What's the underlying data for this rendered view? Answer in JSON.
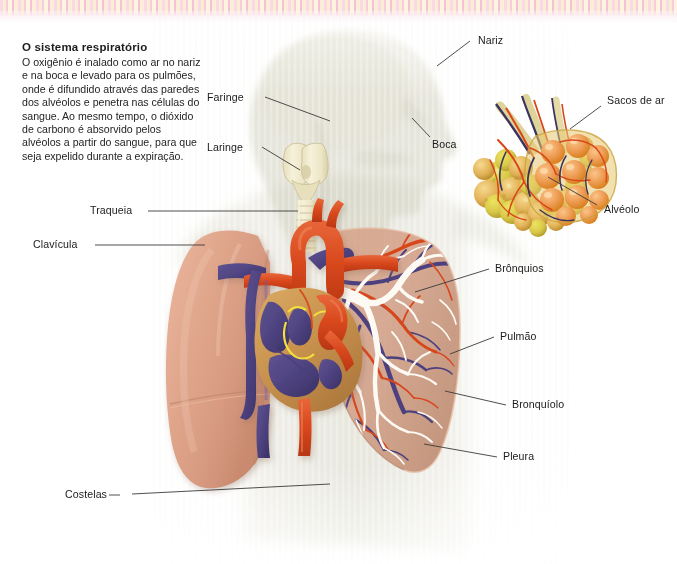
{
  "page": {
    "title": "O sistema respiratório",
    "language": "pt-BR"
  },
  "article": {
    "heading": "O sistema respiratório",
    "body": "O oxigênio é inalado como ar no nariz e na boca e levado para os pulmões, onde é difundido através das paredes dos alvéolos e penetra nas células do sangue. Ao mesmo tempo, o dióxido de carbono é absorvido pelos alvéolos a partir do sangue, para que seja expelido durante a expiração."
  },
  "labels": {
    "nariz": "Nariz",
    "boca": "Boca",
    "faringe": "Faringe",
    "laringe": "Laringe",
    "traqueia": "Traqueia",
    "clavicula": "Clavícula",
    "costelas": "Costelas",
    "bronquios": "Brônquios",
    "pulmao": "Pulmão",
    "bronquiolo": "Bronquíolo",
    "pleura": "Pleura",
    "sacos_de_ar": "Sacos de ar",
    "alveolo": "Alvéolo"
  },
  "colors": {
    "artery": "#d8471c",
    "vein": "#4c417e",
    "heart_muscle": "#c8924e",
    "valve": "#f2de3e",
    "lung_left": "#e0a389",
    "lung_right": "#d9a083",
    "bronchial_tree": "#fdfaf4",
    "cartilage": "#f0ead0",
    "alveoli_sac": "#ee9d55",
    "alveoli_cluster": "#d9c84a",
    "ghost_body": "#d9d8c8",
    "leader_line": "#3a3a3a",
    "band_pink": "#f7c9dd",
    "band_cream": "#fbeccf",
    "text": "#1b1b1b"
  },
  "figure": {
    "caption_type": "anatomical-illustration",
    "inset": "Detalhe ampliado dos sacos de ar e alvéolos"
  }
}
